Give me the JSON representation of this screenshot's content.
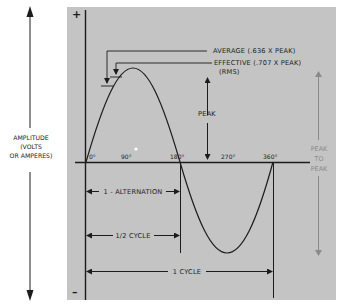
{
  "diagram": {
    "colors": {
      "panel": "#c4c4c4",
      "ink": "#1c1c1c",
      "peak_to_peak": "#8a8a8a",
      "background": "#ffffff"
    },
    "axis": {
      "plus_sign": "+",
      "minus_sign": "–",
      "amplitude_label_line1": "AMPLITUDE",
      "amplitude_label_line2": "(VOLTS",
      "amplitude_label_line3": "OR AMPERES)",
      "degree_ticks": [
        "0°",
        "90°",
        "180°",
        "270°",
        "360°"
      ]
    },
    "annotations": {
      "average": "AVERAGE (.636 X PEAK)",
      "effective": "EFFECTIVE (.707 X PEAK)",
      "rms": "(RMS)",
      "peak": "PEAK",
      "peak_to_peak_line1": "PEAK",
      "peak_to_peak_line2": "TO",
      "peak_to_peak_line3": "PEAK"
    },
    "spans": {
      "alternation": "1 - ALTERNATION",
      "half_cycle": "1/2 CYCLE",
      "full_cycle": "1  CYCLE"
    }
  }
}
